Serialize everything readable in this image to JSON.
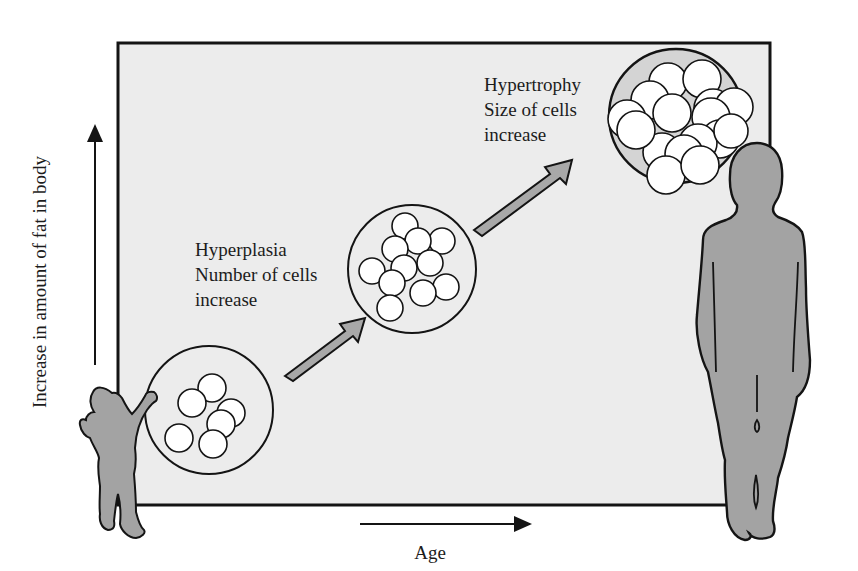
{
  "axes": {
    "y_label": "Increase in amount of fat in body",
    "x_label": "Age"
  },
  "stages": [
    {
      "name": "Hyperplasia",
      "line1": "Hyperplasia",
      "line2": "Number of cells",
      "line3": "increase",
      "cell_count": 13
    },
    {
      "name": "Hypertrophy",
      "line1": "Hypertrophy",
      "line2": "Size of cells",
      "line3": "increase",
      "cell_count": 16
    }
  ],
  "figures": [
    "child-silhouette",
    "adult-silhouette"
  ],
  "colors": {
    "panel": "#ececec",
    "figure_fill": "#a3a3a3",
    "arrow_fill": "#a8a8a8",
    "outline": "#141414",
    "cell_fill": "#ffffff"
  }
}
